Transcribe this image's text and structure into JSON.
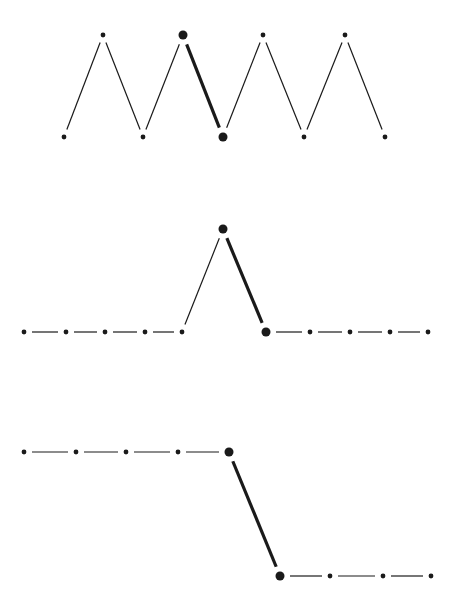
{
  "diagram": {
    "width": 453,
    "height": 610,
    "colors": {
      "ink": "#1a1a1a",
      "background": "#ffffff"
    },
    "panels": [
      {
        "name": "zigzag-panel",
        "points": [
          [
            64,
            137
          ],
          [
            103,
            35
          ],
          [
            143,
            137
          ],
          [
            183,
            35
          ],
          [
            223,
            137
          ],
          [
            263,
            35
          ],
          [
            304,
            137
          ],
          [
            345,
            35
          ],
          [
            385,
            137
          ]
        ],
        "big_points": [
          3,
          4
        ],
        "segments": [
          {
            "from": 0,
            "to": 1,
            "style": "thin"
          },
          {
            "from": 1,
            "to": 2,
            "style": "thin"
          },
          {
            "from": 2,
            "to": 3,
            "style": "thin"
          },
          {
            "from": 3,
            "to": 4,
            "style": "thick"
          },
          {
            "from": 4,
            "to": 5,
            "style": "thin"
          },
          {
            "from": 5,
            "to": 6,
            "style": "thin"
          },
          {
            "from": 6,
            "to": 7,
            "style": "thin"
          },
          {
            "from": 7,
            "to": 8,
            "style": "thin"
          }
        ]
      },
      {
        "name": "single-peak-panel",
        "points": [
          [
            24,
            332
          ],
          [
            66,
            332
          ],
          [
            105,
            332
          ],
          [
            145,
            332
          ],
          [
            182,
            332
          ],
          [
            223,
            229
          ],
          [
            266,
            332
          ],
          [
            310,
            332
          ],
          [
            350,
            332
          ],
          [
            390,
            332
          ],
          [
            428,
            332
          ]
        ],
        "big_points": [
          5,
          6
        ],
        "segments": [
          {
            "from": 0,
            "to": 1,
            "style": "dash"
          },
          {
            "from": 1,
            "to": 2,
            "style": "dash"
          },
          {
            "from": 2,
            "to": 3,
            "style": "dash"
          },
          {
            "from": 3,
            "to": 4,
            "style": "dash"
          },
          {
            "from": 4,
            "to": 5,
            "style": "thin"
          },
          {
            "from": 5,
            "to": 6,
            "style": "thick"
          },
          {
            "from": 6,
            "to": 7,
            "style": "dash"
          },
          {
            "from": 7,
            "to": 8,
            "style": "dash"
          },
          {
            "from": 8,
            "to": 9,
            "style": "dash"
          },
          {
            "from": 9,
            "to": 10,
            "style": "dash"
          }
        ]
      },
      {
        "name": "step-down-panel",
        "points": [
          [
            24,
            452
          ],
          [
            76,
            452
          ],
          [
            126,
            452
          ],
          [
            178,
            452
          ],
          [
            229,
            452
          ],
          [
            280,
            576
          ],
          [
            330,
            576
          ],
          [
            383,
            576
          ],
          [
            431,
            576
          ]
        ],
        "big_points": [
          4,
          5
        ],
        "segments": [
          {
            "from": 0,
            "to": 1,
            "style": "dash"
          },
          {
            "from": 1,
            "to": 2,
            "style": "dash"
          },
          {
            "from": 2,
            "to": 3,
            "style": "dash"
          },
          {
            "from": 3,
            "to": 4,
            "style": "dash"
          },
          {
            "from": 4,
            "to": 5,
            "style": "thick"
          },
          {
            "from": 5,
            "to": 6,
            "style": "dash"
          },
          {
            "from": 6,
            "to": 7,
            "style": "dash"
          },
          {
            "from": 7,
            "to": 8,
            "style": "dash"
          }
        ]
      }
    ]
  }
}
